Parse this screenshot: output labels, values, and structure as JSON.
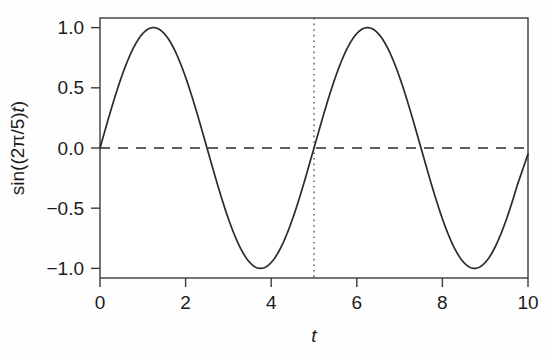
{
  "chart_data": {
    "type": "line",
    "title": "",
    "subtitle": "",
    "xlabel": "t",
    "ylabel": "sin((2π/5)t)",
    "ylabel_parts": {
      "prefix": "sin((2π/5)",
      "italic": "t",
      "suffix": ")"
    },
    "xlim": [
      0,
      10
    ],
    "ylim": [
      -1.08,
      1.08
    ],
    "xticks": [
      0,
      2,
      4,
      6,
      8,
      10
    ],
    "xtick_labels": [
      "0",
      "2",
      "4",
      "6",
      "8",
      "10"
    ],
    "yticks": [
      1.0,
      0.5,
      0.0,
      -0.5,
      -1.0
    ],
    "ytick_labels": [
      "1.0",
      "0.5",
      "0.0",
      "−0.5",
      "−1.0"
    ],
    "grid": false,
    "legend": "none",
    "series": [
      {
        "name": "sin((2π/5)t)",
        "style": "solid",
        "color": "#2b2b2b",
        "x": [
          0.0,
          0.25,
          0.5,
          0.75,
          1.0,
          1.25,
          1.5,
          1.75,
          2.0,
          2.25,
          2.5,
          2.75,
          3.0,
          3.25,
          3.5,
          3.75,
          4.0,
          4.25,
          4.5,
          4.75,
          5.0,
          5.25,
          5.5,
          5.75,
          6.0,
          6.25,
          6.5,
          6.75,
          7.0,
          7.25,
          7.5,
          7.75,
          8.0,
          8.25,
          8.5,
          8.75,
          9.0,
          9.25,
          9.5,
          9.75,
          10.0
        ],
        "y": [
          0.0,
          0.309,
          0.588,
          0.809,
          0.951,
          1.0,
          0.951,
          0.809,
          0.588,
          0.309,
          0.0,
          -0.309,
          -0.588,
          -0.809,
          -0.951,
          -1.0,
          -0.951,
          -0.809,
          -0.588,
          -0.309,
          0.0,
          0.309,
          0.588,
          0.809,
          0.951,
          1.0,
          0.951,
          0.809,
          0.588,
          0.309,
          0.0,
          -0.309,
          -0.588,
          -0.809,
          -0.951,
          -1.0,
          -0.951,
          -0.809,
          -0.588,
          -0.309,
          -0.05
        ]
      }
    ],
    "annotations": [
      {
        "name": "zero-line",
        "type": "hline",
        "value": 0.0,
        "style": "dashed",
        "color": "#2b2b2b"
      },
      {
        "name": "period-marker",
        "type": "vline",
        "value": 5.0,
        "style": "dotted",
        "color": "#555555"
      }
    ],
    "colors": {
      "curve": "#2b2b2b",
      "frame": "#3a3a3a",
      "background": "#fefefe",
      "text": "#1c1c1c"
    }
  }
}
